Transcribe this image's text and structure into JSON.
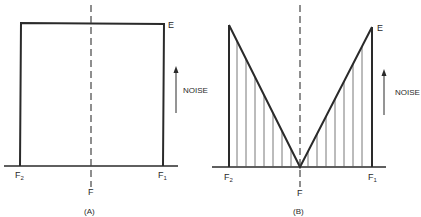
{
  "panels": [
    {
      "id": "A",
      "caption": "(A)",
      "shape": "rectangular",
      "top_label": "E",
      "left_label": "F",
      "left_sub": "2",
      "right_label": "F",
      "right_sub": "1",
      "center_label": "F",
      "axis_label": "NOISE"
    },
    {
      "id": "B",
      "caption": "(B)",
      "shape": "V-shaped (hatched)",
      "top_label": "E",
      "left_label": "F",
      "left_sub": "2",
      "right_label": "F",
      "right_sub": "1",
      "center_label": "F",
      "axis_label": "NOISE"
    }
  ],
  "colors": {
    "line": "#2a2a2a",
    "hatch": "#555555",
    "background": "#ffffff"
  }
}
